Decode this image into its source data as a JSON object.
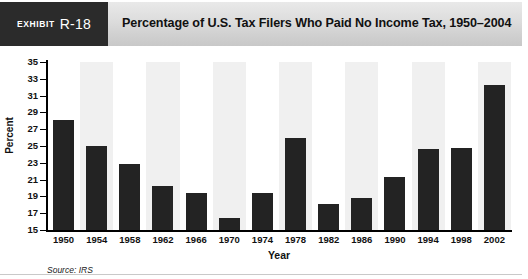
{
  "exhibit": {
    "badge_word": "Exhibit",
    "badge_number": "R-18",
    "title": "Percentage of U.S. Tax Filers Who Paid No Income Tax, 1950–2004",
    "source_note": "Source: IRS"
  },
  "colors": {
    "badge_background": "#2b2b2b",
    "header_background": "#dcdcdc",
    "bar_fill": "#232323",
    "band_shade": "#f0f0f0",
    "band_plain": "#ffffff",
    "axis": "#000000",
    "text": "#111111"
  },
  "chart_data": {
    "type": "bar",
    "title": "Percentage of U.S. Tax Filers Who Paid No Income Tax, 1950–2004",
    "xlabel": "Year",
    "ylabel": "Percent",
    "categories": [
      "1950",
      "1954",
      "1958",
      "1962",
      "1966",
      "1970",
      "1974",
      "1978",
      "1982",
      "1986",
      "1990",
      "1994",
      "1998",
      "2002"
    ],
    "values": [
      28.1,
      25.0,
      22.8,
      20.2,
      19.4,
      16.4,
      19.4,
      26.0,
      18.1,
      18.8,
      21.3,
      24.6,
      24.8,
      32.3
    ],
    "ylim": [
      15,
      35
    ],
    "ytick_step": 2,
    "yticks": [
      "35",
      "33",
      "31",
      "29",
      "27",
      "25",
      "23",
      "21",
      "19",
      "17",
      "15"
    ],
    "grid": false,
    "legend": false,
    "band_pattern": "alternating vertical shading behind every other category"
  }
}
